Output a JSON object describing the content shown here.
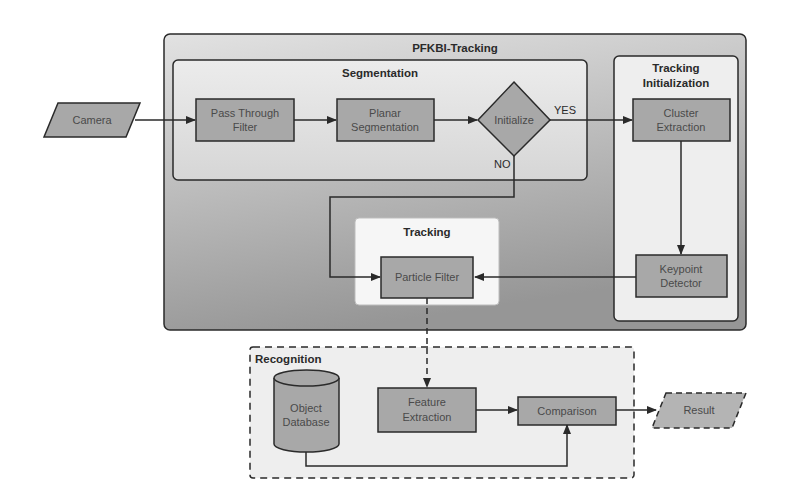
{
  "diagram": {
    "containers": {
      "main": {
        "title": "PFKBI-Tracking"
      },
      "segmentation": {
        "title": "Segmentation"
      },
      "tracking_init": {
        "title_line1": "Tracking",
        "title_line2": "Initialization"
      },
      "tracking": {
        "title": "Tracking"
      },
      "recognition": {
        "title": "Recognition"
      }
    },
    "nodes": {
      "camera": {
        "label": "Camera",
        "shape": "parallelogram"
      },
      "pass_through": {
        "line1": "Pass Through",
        "line2": "Filter"
      },
      "planar": {
        "line1": "Planar",
        "line2": "Segmentation"
      },
      "initialize": {
        "label": "Initialize",
        "shape": "diamond"
      },
      "cluster": {
        "line1": "Cluster",
        "line2": "Extraction"
      },
      "keypoint": {
        "line1": "Keypoint",
        "line2": "Detector"
      },
      "particle": {
        "label": "Particle Filter"
      },
      "database": {
        "line1": "Object",
        "line2": "Database",
        "shape": "cylinder"
      },
      "feature": {
        "line1": "Feature",
        "line2": "Extraction"
      },
      "comparison": {
        "label": "Comparison"
      },
      "result": {
        "label": "Result",
        "shape": "parallelogram-dashed"
      }
    },
    "edge_labels": {
      "yes": "YES",
      "no": "NO"
    },
    "colors": {
      "node_fill": "#a8a8a8",
      "main_fill_top": "#d8d8d8",
      "main_fill_bottom": "#9a9a9a",
      "inner_fill": "#e6e6e6",
      "tracking_fill": "#f7f7f7",
      "stroke": "#2a2a2a"
    }
  }
}
